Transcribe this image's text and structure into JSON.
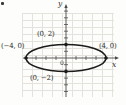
{
  "figure": {
    "type": "ellipse-graph",
    "axis_labels": {
      "x": "x",
      "y": "y"
    },
    "origin_label": "0",
    "ellipse": {
      "center_x": 0,
      "center_y": 0,
      "semi_axis_x": 4,
      "semi_axis_y": 2
    },
    "points": [
      {
        "label": "(0, 2)",
        "x": 0,
        "y": 2
      },
      {
        "label": "(−4, 0)",
        "x": -4,
        "y": 0
      },
      {
        "label": "(4, 0)",
        "x": 4,
        "y": 0
      },
      {
        "label": "(0, −2)",
        "x": 0,
        "y": -2
      }
    ],
    "colors": {
      "curve": "#1c1b1a",
      "axis": "#4c4b49",
      "grid": "#e4e2dd",
      "text": "#2e2d2b",
      "background": "#fdfdfc"
    }
  }
}
